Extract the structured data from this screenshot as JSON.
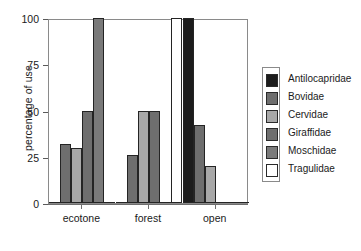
{
  "chart_data": {
    "type": "bar",
    "title": "",
    "subtitle": "",
    "xlabel": "",
    "ylabel": "percentage of use",
    "categories": [
      "ecotone",
      "forest",
      "open"
    ],
    "ylim": [
      0,
      100
    ],
    "yticks": [
      0,
      25,
      50,
      75,
      100
    ],
    "ytick_labels": [
      "0",
      "25",
      "50",
      "75",
      "100"
    ],
    "grid": false,
    "legend_position": "right",
    "series": [
      {
        "name": "Antilocapridae",
        "color": "#1c1c1c",
        "values": [
          0,
          0,
          100
        ]
      },
      {
        "name": "Bovidae",
        "color": "#6e6e6e",
        "values": [
          32,
          26,
          42
        ]
      },
      {
        "name": "Cervidae",
        "color": "#a8a8a8",
        "values": [
          30,
          50,
          20
        ]
      },
      {
        "name": "Giraffidae",
        "color": "#6e6e6e",
        "values": [
          50,
          50,
          0
        ]
      },
      {
        "name": "Moschidae",
        "color": "#7a7a7a",
        "values": [
          100,
          0,
          0
        ]
      },
      {
        "name": "Tragulidae",
        "color": "#ffffff",
        "values": [
          0,
          100,
          0
        ]
      }
    ]
  },
  "legend": {
    "items": [
      {
        "label": "Antilocapridae",
        "color": "#1c1c1c"
      },
      {
        "label": "Bovidae",
        "color": "#6e6e6e"
      },
      {
        "label": "Cervidae",
        "color": "#a8a8a8"
      },
      {
        "label": "Giraffidae",
        "color": "#6e6e6e"
      },
      {
        "label": "Moschidae",
        "color": "#7a7a7a"
      },
      {
        "label": "Tragulidae",
        "color": "#ffffff"
      }
    ]
  },
  "axes": {
    "y_title": "percentage of use",
    "y_tick_labels": [
      "100",
      "75",
      "50",
      "25",
      "0"
    ],
    "x_tick_labels": [
      "ecotone",
      "forest",
      "open"
    ]
  }
}
